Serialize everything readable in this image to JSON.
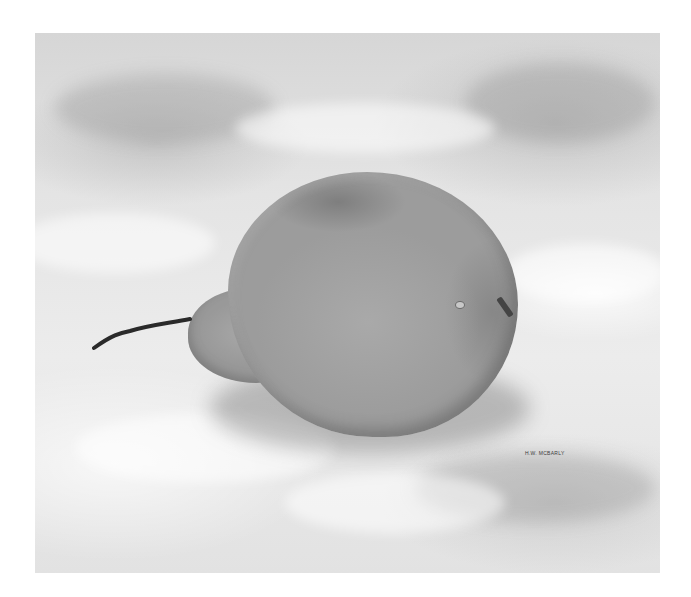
{
  "artwork": {
    "subject": "Graphite drawing of a pear resting on draped white cloth",
    "signature": "H.W. McBARLY",
    "colors": {
      "background": "#ffffff",
      "cloth": "#e4e4e4",
      "pear": "#9c9c9c",
      "stem": "#2a2a2a"
    }
  }
}
